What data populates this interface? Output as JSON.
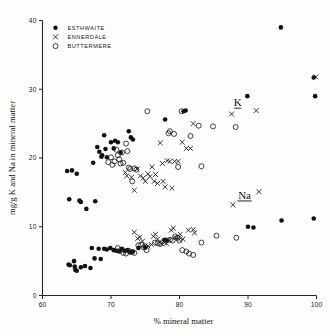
{
  "chart_data": {
    "type": "scatter",
    "title": "",
    "xlabel": "% mineral matter",
    "ylabel": "mg/g K and Na in mineral matter",
    "xlim": [
      60,
      100
    ],
    "ylim": [
      0,
      40
    ],
    "xticks": [
      60,
      70,
      80,
      90,
      100
    ],
    "yticks": [
      0,
      10,
      20,
      30,
      40
    ],
    "grid": false,
    "legend_position": "top-left",
    "annotations": [
      {
        "text": "K",
        "x": 88.5,
        "y": 27.6,
        "underline": true
      },
      {
        "text": "Na",
        "x": 89.5,
        "y": 14.1,
        "underline": true
      }
    ],
    "series": [
      {
        "name": "ESTHWAITE",
        "marker": "filled-circle",
        "points": [
          [
            63.6,
            18.1
          ],
          [
            64.3,
            18.2
          ],
          [
            63.9,
            14.0
          ],
          [
            65.0,
            17.7
          ],
          [
            65.4,
            13.8
          ],
          [
            65.6,
            13.6
          ],
          [
            66.4,
            12.6
          ],
          [
            67.4,
            19.3
          ],
          [
            67.7,
            13.7
          ],
          [
            68.0,
            21.6
          ],
          [
            68.3,
            20.9
          ],
          [
            68.6,
            20.2
          ],
          [
            68.7,
            20.4
          ],
          [
            69.0,
            23.3
          ],
          [
            69.2,
            21.3
          ],
          [
            69.4,
            20.1
          ],
          [
            70.0,
            22.3
          ],
          [
            70.4,
            21.4
          ],
          [
            70.6,
            22.5
          ],
          [
            71.0,
            22.3
          ],
          [
            71.4,
            20.8
          ],
          [
            72.6,
            23.9
          ],
          [
            72.9,
            23.0
          ],
          [
            73.2,
            22.7
          ],
          [
            77.9,
            25.6
          ],
          [
            80.6,
            26.8
          ],
          [
            80.9,
            26.9
          ],
          [
            89.9,
            29.0
          ],
          [
            94.8,
            39.0
          ],
          [
            99.6,
            31.7
          ],
          [
            99.8,
            29.0
          ],
          [
            63.8,
            4.5
          ],
          [
            64.0,
            4.4
          ],
          [
            64.6,
            5.0
          ],
          [
            64.7,
            4.2
          ],
          [
            64.8,
            3.7
          ],
          [
            65.0,
            3.6
          ],
          [
            65.6,
            4.1
          ],
          [
            66.2,
            4.3
          ],
          [
            67.0,
            4.0
          ],
          [
            67.2,
            6.9
          ],
          [
            67.6,
            5.4
          ],
          [
            68.2,
            6.8
          ],
          [
            68.5,
            5.3
          ],
          [
            69.0,
            6.8
          ],
          [
            69.4,
            6.7
          ],
          [
            69.9,
            6.9
          ],
          [
            70.4,
            6.6
          ],
          [
            70.8,
            6.5
          ],
          [
            71.2,
            6.4
          ],
          [
            71.6,
            6.8
          ],
          [
            72.0,
            6.5
          ],
          [
            72.4,
            6.6
          ],
          [
            72.8,
            6.3
          ],
          [
            73.2,
            6.4
          ],
          [
            74.0,
            6.9
          ],
          [
            75.0,
            7.0
          ],
          [
            77.8,
            8.1
          ],
          [
            78.2,
            8.0
          ],
          [
            90.0,
            10.0
          ],
          [
            90.8,
            9.9
          ],
          [
            94.9,
            10.9
          ],
          [
            99.6,
            11.2
          ]
        ]
      },
      {
        "name": "ENNERDALE",
        "marker": "cross",
        "points": [
          [
            72.1,
            17.9
          ],
          [
            72.3,
            17.4
          ],
          [
            73.0,
            17.2
          ],
          [
            73.4,
            15.3
          ],
          [
            73.8,
            18.4
          ],
          [
            74.3,
            17.4
          ],
          [
            74.7,
            17.1
          ],
          [
            75.0,
            16.6
          ],
          [
            75.4,
            17.7
          ],
          [
            75.7,
            17.3
          ],
          [
            76.0,
            18.7
          ],
          [
            76.3,
            16.6
          ],
          [
            76.5,
            17.6
          ],
          [
            76.8,
            16.3
          ],
          [
            77.2,
            22.2
          ],
          [
            77.5,
            19.2
          ],
          [
            77.6,
            16.6
          ],
          [
            77.9,
            15.8
          ],
          [
            78.2,
            19.6
          ],
          [
            78.6,
            19.5
          ],
          [
            78.9,
            15.6
          ],
          [
            79.3,
            19.5
          ],
          [
            79.8,
            19.5
          ],
          [
            80.4,
            22.3
          ],
          [
            81.0,
            21.4
          ],
          [
            81.6,
            21.4
          ],
          [
            82.0,
            25.0
          ],
          [
            87.6,
            26.4
          ],
          [
            91.2,
            26.9
          ],
          [
            99.9,
            31.8
          ],
          [
            73.4,
            9.2
          ],
          [
            73.9,
            8.3
          ],
          [
            74.2,
            8.5
          ],
          [
            74.6,
            7.9
          ],
          [
            75.0,
            7.3
          ],
          [
            75.4,
            7.2
          ],
          [
            75.9,
            7.4
          ],
          [
            76.2,
            8.6
          ],
          [
            76.5,
            8.9
          ],
          [
            76.8,
            8.2
          ],
          [
            77.1,
            7.8
          ],
          [
            77.4,
            7.5
          ],
          [
            77.8,
            7.7
          ],
          [
            78.1,
            7.6
          ],
          [
            78.4,
            8.1
          ],
          [
            78.8,
            9.5
          ],
          [
            79.1,
            9.8
          ],
          [
            79.4,
            8.4
          ],
          [
            79.8,
            8.3
          ],
          [
            80.1,
            8.9
          ],
          [
            80.5,
            8.2
          ],
          [
            81.3,
            9.5
          ],
          [
            82.0,
            9.6
          ],
          [
            82.2,
            9.1
          ],
          [
            87.8,
            13.2
          ],
          [
            91.6,
            15.1
          ]
        ]
      },
      {
        "name": "BUTTERMERE",
        "marker": "open-circle",
        "points": [
          [
            69.6,
            19.4
          ],
          [
            70.0,
            20.1
          ],
          [
            70.2,
            19.0
          ],
          [
            70.5,
            19.5
          ],
          [
            70.8,
            21.2
          ],
          [
            71.0,
            20.4
          ],
          [
            71.2,
            19.8
          ],
          [
            71.4,
            19.2
          ],
          [
            71.6,
            20.8
          ],
          [
            71.8,
            19.3
          ],
          [
            72.2,
            22.1
          ],
          [
            72.4,
            21.0
          ],
          [
            72.6,
            18.6
          ],
          [
            72.8,
            18.4
          ],
          [
            73.1,
            16.6
          ],
          [
            73.4,
            18.5
          ],
          [
            73.7,
            18.3
          ],
          [
            75.3,
            26.8
          ],
          [
            78.4,
            23.6
          ],
          [
            78.6,
            23.9
          ],
          [
            79.2,
            23.5
          ],
          [
            79.8,
            18.7
          ],
          [
            80.3,
            26.8
          ],
          [
            81.6,
            23.2
          ],
          [
            82.8,
            24.7
          ],
          [
            83.2,
            18.8
          ],
          [
            84.9,
            24.6
          ],
          [
            88.2,
            24.5
          ],
          [
            71.0,
            6.9
          ],
          [
            71.4,
            6.6
          ],
          [
            71.8,
            6.2
          ],
          [
            72.2,
            6.1
          ],
          [
            72.6,
            6.5
          ],
          [
            73.0,
            6.3
          ],
          [
            73.4,
            6.2
          ],
          [
            74.0,
            7.3
          ],
          [
            74.4,
            7.4
          ],
          [
            74.8,
            7.0
          ],
          [
            75.2,
            6.6
          ],
          [
            76.4,
            7.7
          ],
          [
            76.8,
            7.6
          ],
          [
            77.2,
            7.5
          ],
          [
            78.6,
            8.1
          ],
          [
            79.0,
            8.0
          ],
          [
            79.4,
            8.6
          ],
          [
            79.7,
            8.4
          ],
          [
            80.0,
            8.0
          ],
          [
            80.4,
            6.6
          ],
          [
            81.0,
            6.4
          ],
          [
            81.4,
            6.1
          ],
          [
            82.0,
            5.9
          ],
          [
            83.2,
            7.7
          ],
          [
            85.4,
            8.7
          ],
          [
            88.3,
            8.4
          ]
        ]
      }
    ]
  },
  "legend": {
    "items": [
      {
        "marker": "filled-circle",
        "label": "ESTHWAITE"
      },
      {
        "marker": "cross",
        "label": "ENNERDALE"
      },
      {
        "marker": "open-circle",
        "label": "BUTTERMERE"
      }
    ]
  },
  "axes": {
    "x_tick_labels": [
      "60",
      "70",
      "80",
      "90",
      "100"
    ],
    "y_tick_labels": [
      "0",
      "10",
      "20",
      "30",
      "40"
    ],
    "x_title": "% mineral matter",
    "y_title": "mg/g K and Na in mineral matter"
  }
}
